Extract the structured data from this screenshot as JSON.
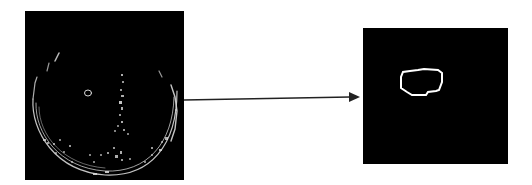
{
  "figure": {
    "type": "image-processing-pipeline",
    "panels": [
      {
        "id": "input",
        "description": "Edge-detected grayscale image of a circular region with speckled edge points and a small elliptical contour",
        "background": "#000000",
        "foreground": "#e0e0e0"
      },
      {
        "id": "output",
        "description": "Extracted single closed contour (segmented region of interest)",
        "background": "#000000",
        "foreground": "#ffffff"
      }
    ],
    "arrow": {
      "direction": "left-to-right",
      "color": "#222222",
      "from": "input",
      "to": "output"
    }
  }
}
